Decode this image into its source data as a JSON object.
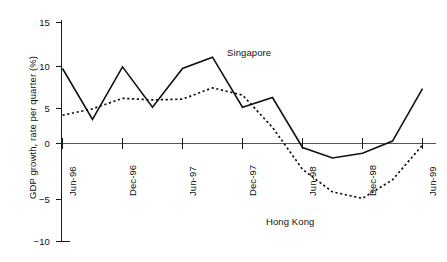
{
  "chart_data": {
    "type": "line",
    "title": "",
    "subtitle": "",
    "xlabel": "",
    "ylabel": "GDP growth, rate per quarter (%)",
    "ylim": [
      -10,
      15
    ],
    "yticks": [
      15,
      10,
      5,
      0,
      -5,
      -10
    ],
    "ytick_labels": [
      "15",
      "10",
      "5",
      "0",
      "−5",
      "−10"
    ],
    "xticks": [
      "Jun-96",
      "Dec-96",
      "Jun-97",
      "Dec-97",
      "Jun-98",
      "Dec-98",
      "Jun-99"
    ],
    "x": [
      "Jun-96",
      "Sep-96",
      "Dec-96",
      "Mar-97",
      "Jun-97",
      "Sep-97",
      "Dec-97",
      "Mar-98",
      "Jun-98",
      "Sep-98",
      "Dec-98",
      "Mar-99",
      "Jun-99"
    ],
    "grid": false,
    "legend_position": "inline-annotations",
    "series": [
      {
        "name": "Singapore",
        "style": "solid",
        "color": "#111111",
        "values": [
          9.3,
          3.0,
          9.5,
          4.5,
          9.3,
          10.7,
          4.5,
          5.7,
          -0.5,
          -1.8,
          -1.2,
          0.3,
          6.8
        ]
      },
      {
        "name": "Hong Kong",
        "style": "dotted",
        "color": "#111111",
        "values": [
          3.5,
          4.3,
          5.6,
          5.4,
          5.5,
          6.9,
          6.0,
          2.0,
          -3.2,
          -6.0,
          -6.8,
          -4.5,
          -0.2
        ]
      }
    ],
    "annotations": [
      {
        "text": "Singapore",
        "series": "Singapore"
      },
      {
        "text": "Hong Kong",
        "series": "Hong Kong"
      }
    ]
  },
  "axes": {
    "y_label": "GDP growth, rate per quarter (%)",
    "y_tick_labels": [
      "15",
      "10",
      "5",
      "0",
      "−5",
      "−10"
    ],
    "x_tick_labels": [
      "Jun-96",
      "Dec-96",
      "Jun-97",
      "Dec-97",
      "Jun-98",
      "Dec-98",
      "Jun-99"
    ]
  },
  "annotations": {
    "singapore": "Singapore",
    "hong_kong": "Hong Kong"
  },
  "colors": {
    "axis": "#1a1a1a",
    "zero_line": "#555555",
    "series": "#111111",
    "background": "#ffffff"
  }
}
